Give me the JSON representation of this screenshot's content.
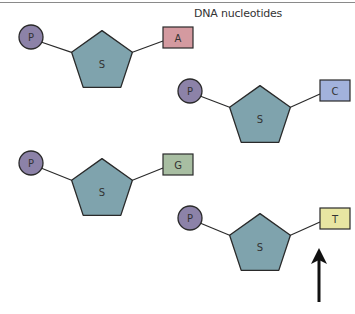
{
  "title": "DNA nucleotides",
  "labels": {
    "phosphate": "P",
    "sugar": "S"
  },
  "colors": {
    "phosphate": "#8c82a8",
    "sugar": "#7fa3ad",
    "A": "#d49aa0",
    "C": "#a2b2dc",
    "G": "#a8bea2",
    "T": "#e8e6a2",
    "stroke": "#2a2a2a"
  },
  "nucleotides": [
    {
      "base": "A",
      "px": 31,
      "py": 37,
      "cx": 102,
      "cy": 62,
      "bx": 163,
      "by": 27
    },
    {
      "base": "C",
      "px": 190,
      "py": 91,
      "cx": 260,
      "cy": 117,
      "bx": 320,
      "by": 80
    },
    {
      "base": "G",
      "px": 31,
      "py": 163,
      "cx": 102,
      "cy": 190,
      "bx": 163,
      "by": 154
    },
    {
      "base": "T",
      "px": 190,
      "py": 218,
      "cx": 260,
      "cy": 245,
      "bx": 320,
      "by": 208
    }
  ],
  "arrow": {
    "x": 319,
    "y1": 302,
    "y2": 248,
    "points_to": "T"
  }
}
